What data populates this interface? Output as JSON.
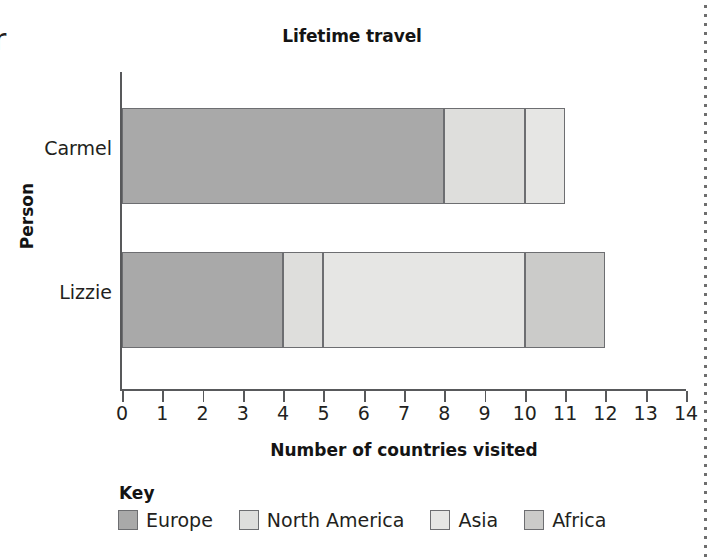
{
  "cutoff_text": "r",
  "chart_data": {
    "type": "bar",
    "orientation": "horizontal",
    "stacked": true,
    "title": "Lifetime travel",
    "xlabel": "Number of countries visited",
    "ylabel": "Person",
    "categories": [
      "Carmel",
      "Lizzie"
    ],
    "series": [
      {
        "name": "Europe",
        "color": "#a9a9a9",
        "values": [
          8,
          4
        ]
      },
      {
        "name": "North America",
        "color": "#dededc",
        "values": [
          2,
          1
        ]
      },
      {
        "name": "Asia",
        "color": "#e6e6e4",
        "values": [
          1,
          5
        ]
      },
      {
        "name": "Africa",
        "color": "#cbcbc9",
        "values": [
          0,
          2
        ]
      }
    ],
    "totals": [
      11,
      12
    ],
    "xlim": [
      0,
      14
    ],
    "xticks": [
      "0",
      "1",
      "2",
      "3",
      "4",
      "5",
      "6",
      "7",
      "8",
      "9",
      "10",
      "11",
      "12",
      "13",
      "14"
    ],
    "grid": false,
    "legend_title": "Key",
    "legend_position": "bottom-left"
  }
}
